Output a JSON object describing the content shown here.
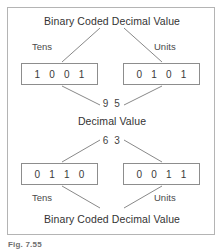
{
  "figure": {
    "caption": "Fig. 7.55",
    "border_color": "#b4b4b4",
    "box_border_color": "#8d8d8d",
    "line_color": "#7a7a7a",
    "text_color": "#3b3b3b"
  },
  "top_section": {
    "title": "Binary Coded Decimal Value",
    "tens_label": "Tens",
    "units_label": "Units",
    "tens_bits": "1 0 0 1",
    "units_bits": "0 1 0 1",
    "decimal_value": "9 5"
  },
  "middle": {
    "title": "Decimal Value"
  },
  "bottom_section": {
    "decimal_value": "6 3",
    "tens_bits": "0 1 1 0",
    "units_bits": "0 0 1 1",
    "tens_label": "Tens",
    "units_label": "Units",
    "title": "Binary Coded Decimal Value"
  }
}
